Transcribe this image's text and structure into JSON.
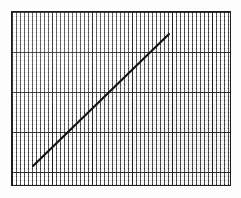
{
  "figure": {
    "title": "",
    "background_color": "#fdfdfd",
    "caption": ""
  },
  "plot_area": {
    "name": "graph-paper-grid",
    "x": 11,
    "y": 11,
    "width": 220,
    "height": 175,
    "border_color": "#1d1d1d",
    "border_width": 1,
    "fill_color": "#f2f2f2"
  },
  "grid": {
    "minor_spacing_px": 4,
    "major_spacing_px": 40,
    "minor_color": "#232323",
    "major_color": "#141414",
    "minor_columns": 55,
    "minor_rows": 44,
    "major_columns": 5,
    "major_rows": 4,
    "visible": true
  },
  "chart_data": {
    "type": "line",
    "title": "",
    "subtitle": "",
    "xlabel": "",
    "ylabel": "",
    "grid": true,
    "legend_position": "none",
    "xlim": [
      0,
      55
    ],
    "ylim": [
      0,
      44
    ],
    "xticks": [],
    "yticks": [],
    "annotations": [],
    "series": [
      {
        "name": "linear-trend",
        "color": "#111111",
        "line_width": 2,
        "marker": "none",
        "x": [
          5.5,
          12.3,
          19.2,
          26.0,
          32.8,
          39.5
        ],
        "y": [
          5.1,
          11.7,
          18.3,
          24.9,
          31.5,
          38.0
        ],
        "pixel_start": {
          "x": 33,
          "y": 166
        },
        "pixel_end": {
          "x": 169,
          "y": 34
        }
      }
    ]
  }
}
